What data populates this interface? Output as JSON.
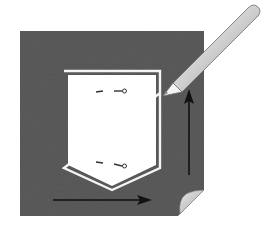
{
  "figure": {
    "colors": {
      "background": "#ffffff",
      "fabric": "#5a5a5a",
      "pocket_fill": "#ffffff",
      "outline": "#f2f2f2",
      "arrow": "#111111",
      "pencil_body": "#d9d9d9",
      "pencil_tip": "#f4f4f4",
      "corner_curl": "#cfcfcf"
    },
    "elements": {
      "fabric": "dark fabric square with curled bottom-right corner",
      "pocket": "white pocket template with pointed bottom",
      "pins": [
        "upper pin mark",
        "lower pin mark"
      ],
      "arrows": [
        "horizontal arrow pointing right",
        "vertical arrow pointing up"
      ],
      "pencil": "pencil tracing the pocket outline"
    }
  }
}
